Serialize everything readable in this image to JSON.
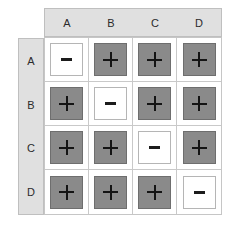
{
  "figure": {
    "type": "matrix-grid",
    "rows": 4,
    "columns": 4
  },
  "colors": {
    "header_band": "#e0e0e0",
    "header_border": "#bfbfbf",
    "cell_positive_fill": "#8a8a8a",
    "cell_positive_border": "#6e6e6e",
    "cell_negative_fill": "#ffffff",
    "cell_negative_border": "#b5b5b5",
    "grid_line": "#c9c9c9",
    "glyph": "#141414",
    "page_background": "#ffffff"
  },
  "column_headers": [
    "A",
    "B",
    "C",
    "D"
  ],
  "row_labels": [
    "A",
    "B",
    "C",
    "D"
  ],
  "symbols": {
    "positive": "+",
    "negative": "−"
  },
  "cells": [
    [
      {
        "symbol": "−",
        "state": "negative"
      },
      {
        "symbol": "+",
        "state": "positive"
      },
      {
        "symbol": "+",
        "state": "positive"
      },
      {
        "symbol": "+",
        "state": "positive"
      }
    ],
    [
      {
        "symbol": "+",
        "state": "positive"
      },
      {
        "symbol": "−",
        "state": "negative"
      },
      {
        "symbol": "+",
        "state": "positive"
      },
      {
        "symbol": "+",
        "state": "positive"
      }
    ],
    [
      {
        "symbol": "+",
        "state": "positive"
      },
      {
        "symbol": "+",
        "state": "positive"
      },
      {
        "symbol": "−",
        "state": "negative"
      },
      {
        "symbol": "+",
        "state": "positive"
      }
    ],
    [
      {
        "symbol": "+",
        "state": "positive"
      },
      {
        "symbol": "+",
        "state": "positive"
      },
      {
        "symbol": "+",
        "state": "positive"
      },
      {
        "symbol": "−",
        "state": "negative"
      }
    ]
  ]
}
